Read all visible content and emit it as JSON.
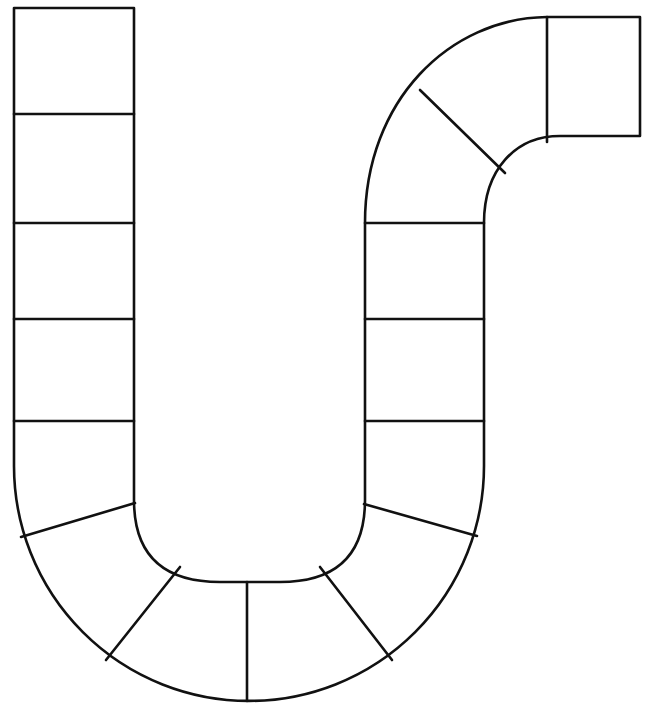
{
  "board": {
    "title": "",
    "description": "Blank S-shaped board game path with empty spaces",
    "line_color": "#111111",
    "background_color": "#ffffff",
    "space_count": 18,
    "spaces": [
      {
        "id": 1,
        "section": "left-column"
      },
      {
        "id": 2,
        "section": "left-column"
      },
      {
        "id": 3,
        "section": "left-column"
      },
      {
        "id": 4,
        "section": "left-column"
      },
      {
        "id": 5,
        "section": "left-column"
      },
      {
        "id": 6,
        "section": "bottom-curve"
      },
      {
        "id": 7,
        "section": "bottom-curve"
      },
      {
        "id": 8,
        "section": "bottom-curve"
      },
      {
        "id": 9,
        "section": "bottom-curve"
      },
      {
        "id": 10,
        "section": "bottom-curve"
      },
      {
        "id": 11,
        "section": "bottom-curve"
      },
      {
        "id": 12,
        "section": "middle-column"
      },
      {
        "id": 13,
        "section": "middle-column"
      },
      {
        "id": 14,
        "section": "middle-column"
      },
      {
        "id": 15,
        "section": "top-curve"
      },
      {
        "id": 16,
        "section": "top-curve"
      },
      {
        "id": 17,
        "section": "top-curve"
      },
      {
        "id": 18,
        "section": "end-box"
      }
    ]
  }
}
